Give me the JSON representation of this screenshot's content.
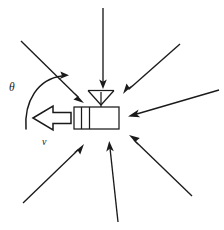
{
  "figure": {
    "background_color": "#ffffff",
    "ink_color": "#1a1a1a",
    "width": 224,
    "height": 230
  },
  "labels": {
    "angle": "θ",
    "velocity": "v"
  },
  "device": {
    "name": "mobile-receiver",
    "body": {
      "x": 74,
      "y": 107,
      "width": 45,
      "height": 22
    },
    "dividers": [
      81,
      89
    ],
    "mast": {
      "x": 101,
      "y_top": 92,
      "y_bottom": 127
    },
    "antenna_triangle": {
      "left_x": 88,
      "right_x": 114,
      "top_y": 90,
      "apex_y": 105
    }
  },
  "velocity_arrow": {
    "name": "velocity-arrow",
    "direction": "left",
    "tip_x": 33,
    "tail_x": 70,
    "center_y": 118
  },
  "angle_arc": {
    "name": "theta-arc",
    "from_angle_deg": 200,
    "to_angle_deg": 55,
    "center_x": 40,
    "center_y": 105,
    "radius": 28
  },
  "incoming_arrows": [
    {
      "name": "arrival-arrow-top",
      "x1": 103,
      "y1": 8,
      "x2": 103,
      "y2": 86
    },
    {
      "name": "arrival-arrow-upper-left",
      "x1": 21,
      "y1": 41,
      "x2": 82,
      "y2": 101
    },
    {
      "name": "arrival-arrow-upper-right",
      "x1": 180,
      "y1": 44,
      "x2": 124,
      "y2": 93
    },
    {
      "name": "arrival-arrow-right",
      "x1": 219,
      "y1": 90,
      "x2": 129,
      "y2": 116
    },
    {
      "name": "arrival-arrow-lower-right",
      "x1": 192,
      "y1": 196,
      "x2": 130,
      "y2": 136
    },
    {
      "name": "arrival-arrow-bottom",
      "x1": 118,
      "y1": 222,
      "x2": 109,
      "y2": 142
    },
    {
      "name": "arrival-arrow-lower-left",
      "x1": 23,
      "y1": 203,
      "x2": 83,
      "y2": 145
    },
    {
      "name": "arrival-arrow-far-lower-left",
      "x1": 3,
      "y1": 172,
      "x2": 3,
      "y2": 172
    }
  ],
  "counts": {
    "incoming_arrows": 7
  }
}
